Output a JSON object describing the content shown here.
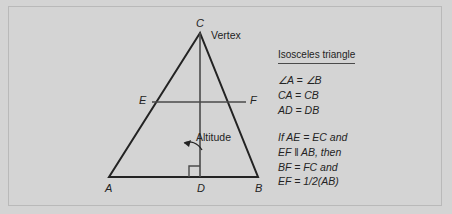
{
  "figure": {
    "background_color": "#d4d4d4",
    "ink_color": "#232323",
    "border_color": "#b9b9b9"
  },
  "diagram": {
    "labels": {
      "apex": "C",
      "base_left": "A",
      "base_right": "B",
      "foot": "D",
      "mid_left": "E",
      "mid_right": "F",
      "vertex_callout": "Vertex",
      "altitude_callout": "Altitude"
    },
    "geometry": {
      "apex": [
        200,
        33
      ],
      "base_left": [
        109,
        177
      ],
      "base_right": [
        258,
        177
      ],
      "foot": [
        200,
        177
      ],
      "mid_left": [
        152,
        102
      ],
      "mid_right": [
        246,
        102
      ],
      "right_angle_marker_size": 11
    }
  },
  "panel": {
    "heading": "Isosceles triangle",
    "equations": [
      "∠A = ∠B",
      "CA = CB",
      "AD = DB"
    ],
    "conditional": [
      "If AE = EC and",
      "EF ‖ AB, then",
      "BF = FC and",
      "EF = 1/2(AB)"
    ]
  }
}
